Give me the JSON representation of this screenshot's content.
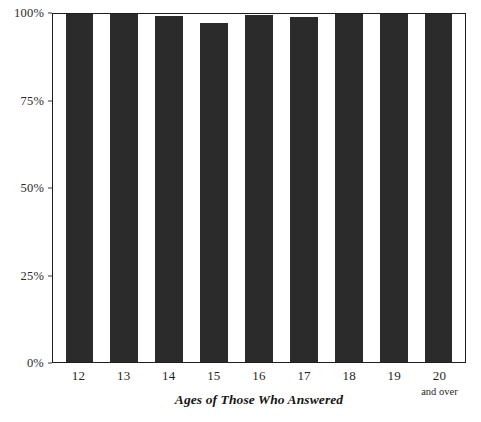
{
  "chart_data": {
    "type": "bar",
    "title": "",
    "subtitle": "",
    "xlabel": "Ages of Those Who Answered",
    "ylabel": "",
    "categories": [
      "12",
      "13",
      "14",
      "15",
      "16",
      "17",
      "18",
      "19",
      "20"
    ],
    "category_sublabels": [
      "",
      "",
      "",
      "",
      "",
      "",
      "",
      "",
      "and over"
    ],
    "values": [
      100,
      100,
      99.5,
      97.5,
      99.8,
      99,
      100,
      100,
      100
    ],
    "ylim": [
      0,
      100
    ],
    "ytick_values": [
      0,
      25,
      50,
      75,
      100
    ],
    "ytick_labels": [
      "0%",
      "25%",
      "50%",
      "75%",
      "100%"
    ],
    "grid": false,
    "legend": null,
    "legend_position": "none",
    "bar_color": "#2b2b2b",
    "frame_color": "#1d1d1d",
    "background_color": "#ffffff",
    "annotations": []
  }
}
